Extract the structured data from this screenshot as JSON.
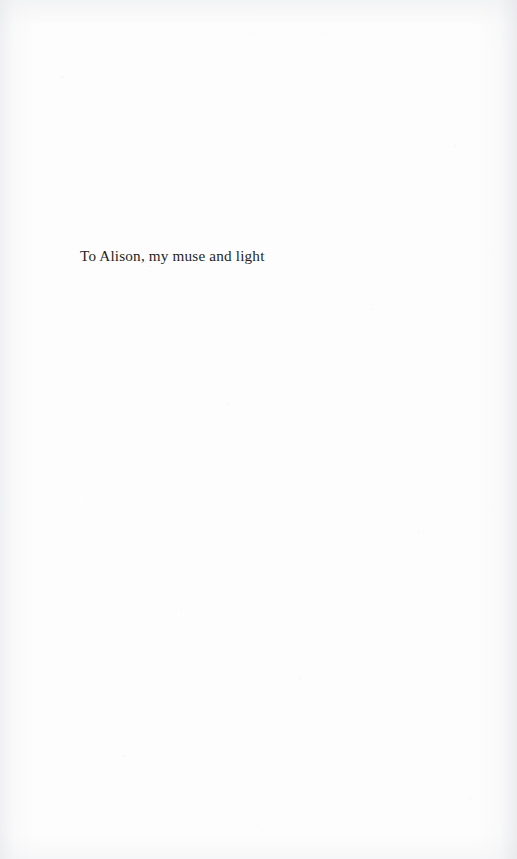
{
  "page": {
    "kind": "book-dedication-page",
    "width": 517,
    "height": 859,
    "paper_color": "#fdfdfd",
    "edge_shadow_color": "#e4e5e8"
  },
  "dedication": {
    "text": "To Alison, my muse and light",
    "text_color": "#1f1f1f",
    "left_px": 80,
    "top_px": 231,
    "font_size_px": 15.2
  }
}
